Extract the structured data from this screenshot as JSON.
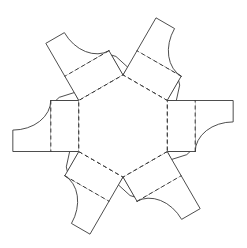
{
  "document": {
    "title": "Hexagonal Box Papercraft Net",
    "description": "Unfolded flat net of a hexagonal box with six side panels and six curved closing flaps",
    "width": 247,
    "height": 248
  },
  "colors": {
    "background": "#ffffff",
    "cut_line": "#3a3a3a",
    "fold_line": "#2b2b2b",
    "face_fill": "#ffffff"
  },
  "geometry": {
    "center_x": 123,
    "center_y": 126,
    "hex_circumradius": 51,
    "panel_height": 28,
    "flap_radius": 38,
    "tab_depth": 9,
    "panel_count": 6,
    "rotation_step_degrees": 60,
    "base_rotation_degrees": 0
  },
  "line_styles": {
    "fold": "dashed",
    "cut": "solid",
    "dash_pattern": "4 3",
    "stroke_width": 0.9
  },
  "parts": {
    "base_face": {
      "name": "hexagonal-base",
      "sides": 6,
      "line_type": "fold"
    },
    "side_panels": [
      {
        "index": 0,
        "label": "side-panel-top",
        "angle": 270
      },
      {
        "index": 1,
        "label": "side-panel-upper-right",
        "angle": 330
      },
      {
        "index": 2,
        "label": "side-panel-lower-right",
        "angle": 30
      },
      {
        "index": 3,
        "label": "side-panel-bottom",
        "angle": 90
      },
      {
        "index": 4,
        "label": "side-panel-lower-left",
        "angle": 150
      },
      {
        "index": 5,
        "label": "side-panel-upper-left",
        "angle": 210
      }
    ],
    "closing_flaps": [
      {
        "index": 0,
        "label": "closing-flap-top",
        "curve_side": "left"
      },
      {
        "index": 1,
        "label": "closing-flap-upper-right",
        "curve_side": "left"
      },
      {
        "index": 2,
        "label": "closing-flap-lower-right",
        "curve_side": "left"
      },
      {
        "index": 3,
        "label": "closing-flap-bottom",
        "curve_side": "left"
      },
      {
        "index": 4,
        "label": "closing-flap-lower-left",
        "curve_side": "left"
      },
      {
        "index": 5,
        "label": "closing-flap-upper-left",
        "curve_side": "left"
      }
    ],
    "glue_tabs": [
      {
        "index": 0,
        "label": "glue-tab-1"
      },
      {
        "index": 1,
        "label": "glue-tab-2"
      },
      {
        "index": 2,
        "label": "glue-tab-3"
      },
      {
        "index": 3,
        "label": "glue-tab-4"
      },
      {
        "index": 4,
        "label": "glue-tab-5"
      },
      {
        "index": 5,
        "label": "glue-tab-6"
      }
    ]
  }
}
